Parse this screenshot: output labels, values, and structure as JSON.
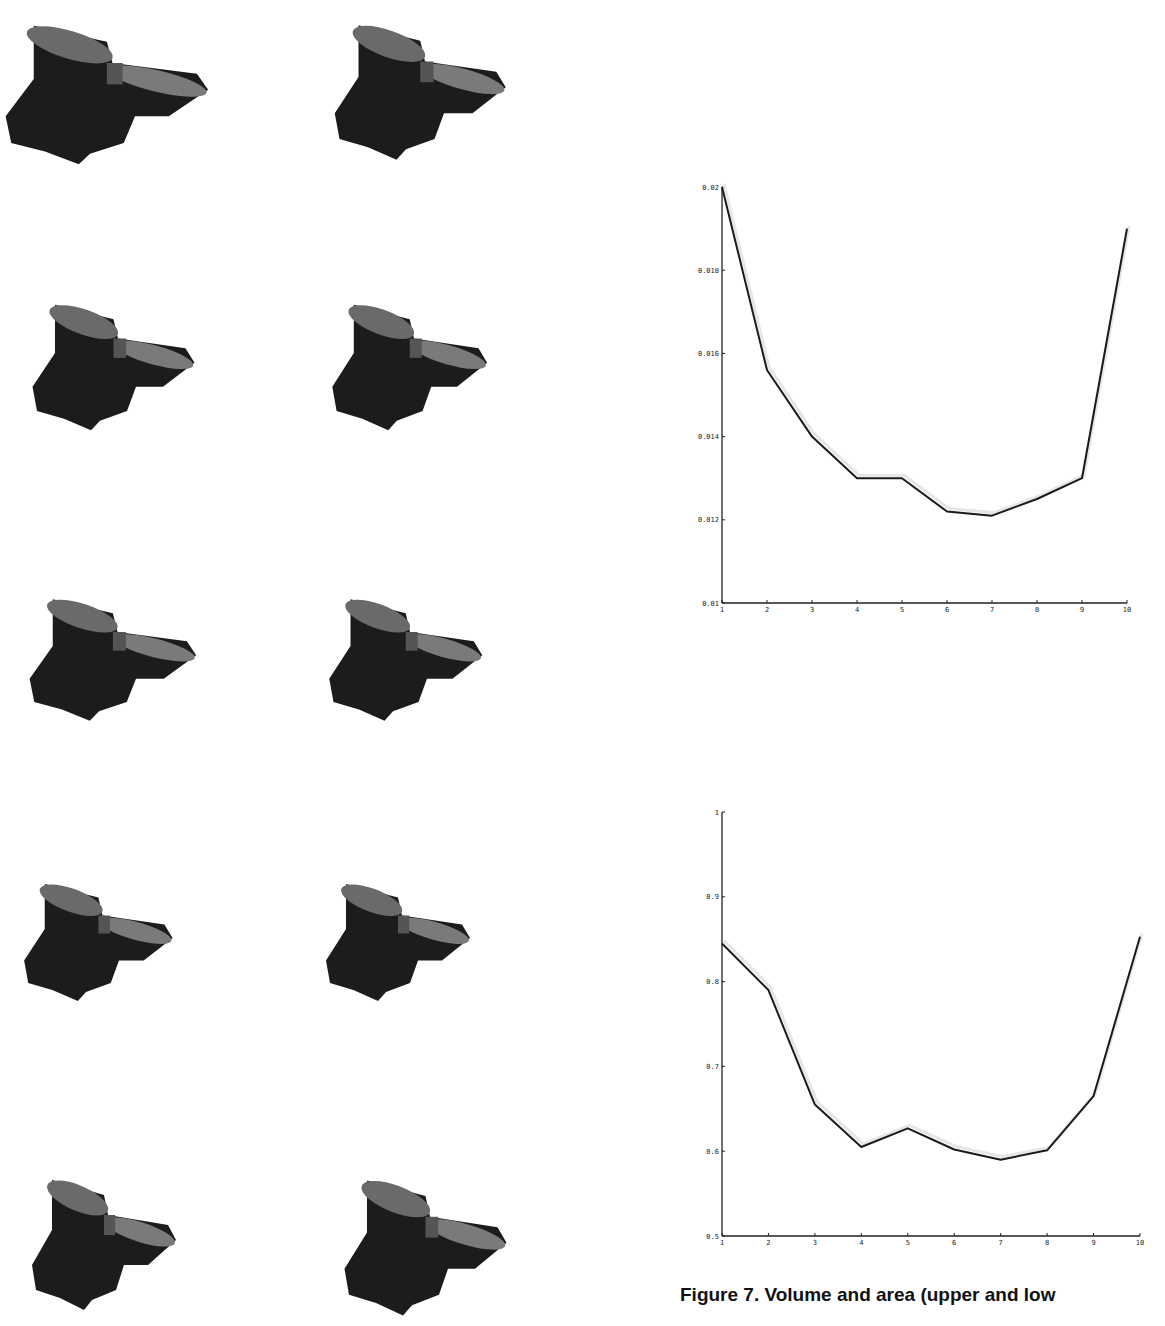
{
  "figure": {
    "caption": "Figure 7. Volume and area (upper and low",
    "thumbnails": [
      {
        "row": 1,
        "col": 1,
        "label": "rendered-shape-1"
      },
      {
        "row": 1,
        "col": 2,
        "label": "rendered-shape-2"
      },
      {
        "row": 2,
        "col": 1,
        "label": "rendered-shape-3"
      },
      {
        "row": 2,
        "col": 2,
        "label": "rendered-shape-4"
      },
      {
        "row": 3,
        "col": 1,
        "label": "rendered-shape-5"
      },
      {
        "row": 3,
        "col": 2,
        "label": "rendered-shape-6"
      },
      {
        "row": 4,
        "col": 1,
        "label": "rendered-shape-7"
      },
      {
        "row": 4,
        "col": 2,
        "label": "rendered-shape-8"
      },
      {
        "row": 5,
        "col": 1,
        "label": "rendered-shape-9"
      },
      {
        "row": 5,
        "col": 2,
        "label": "rendered-shape-10"
      }
    ]
  },
  "chart_data": [
    {
      "type": "line",
      "title": "",
      "xlabel": "",
      "ylabel": "",
      "x": [
        1,
        2,
        3,
        4,
        5,
        6,
        7,
        8,
        9,
        10
      ],
      "values": [
        0.02,
        0.0156,
        0.014,
        0.013,
        0.013,
        0.0122,
        0.0121,
        0.0125,
        0.013,
        0.019
      ],
      "xlim": [
        1,
        10
      ],
      "ylim": [
        0.01,
        0.02
      ],
      "xticks": [
        "1",
        "2",
        "3",
        "4",
        "5",
        "6",
        "7",
        "8",
        "9",
        "10"
      ],
      "yticks": [
        "0.01",
        "0.012",
        "0.014",
        "0.016",
        "0.018",
        "0.02"
      ],
      "grid": false,
      "legend": null,
      "color": "#1a1a1a"
    },
    {
      "type": "line",
      "title": "",
      "xlabel": "",
      "ylabel": "",
      "x": [
        1,
        2,
        3,
        4,
        5,
        6,
        7,
        8,
        9,
        10
      ],
      "values": [
        0.845,
        0.79,
        0.655,
        0.605,
        0.627,
        0.602,
        0.59,
        0.601,
        0.665,
        0.853
      ],
      "xlim": [
        1,
        10
      ],
      "ylim": [
        0.5,
        1.0
      ],
      "xticks": [
        "1",
        "2",
        "3",
        "4",
        "5",
        "6",
        "7",
        "8",
        "9",
        "10"
      ],
      "yticks": [
        "0.5",
        "0.6",
        "0.7",
        "0.8",
        "0.9",
        "1"
      ],
      "grid": false,
      "legend": null,
      "color": "#1a1a1a"
    }
  ]
}
